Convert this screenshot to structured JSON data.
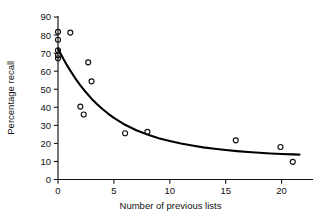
{
  "chart_data": {
    "type": "scatter",
    "title": "",
    "subtitle": "",
    "xlabel": "Number of previous lists",
    "ylabel": "Percentage recall",
    "xlim": [
      -1.2,
      23.5
    ],
    "ylim": [
      0,
      90
    ],
    "xticks": [
      0,
      5,
      10,
      15,
      20
    ],
    "yticks": [
      0,
      10,
      20,
      30,
      40,
      50,
      60,
      70,
      80,
      90
    ],
    "xticklabels": [
      "0",
      "5",
      "10",
      "15",
      "20"
    ],
    "yticklabels": [
      "0",
      "10",
      "20",
      "30",
      "40",
      "50",
      "60",
      "70",
      "80",
      "90"
    ],
    "grid": false,
    "legend": null,
    "legend_position": "none",
    "marker": "open-circle",
    "marker_color": "#111111",
    "curve_color": "#000000",
    "points": [
      {
        "x": 0.0,
        "y": 81.8
      },
      {
        "x": 1.1,
        "y": 81.4
      },
      {
        "x": 0.0,
        "y": 77.4
      },
      {
        "x": 0.0,
        "y": 71.6
      },
      {
        "x": 0.0,
        "y": 68.8
      },
      {
        "x": 0.0,
        "y": 67.2
      },
      {
        "x": 2.7,
        "y": 64.9
      },
      {
        "x": 3.0,
        "y": 54.4
      },
      {
        "x": 2.0,
        "y": 40.4
      },
      {
        "x": 2.3,
        "y": 36.0
      },
      {
        "x": 6.0,
        "y": 25.6
      },
      {
        "x": 8.0,
        "y": 26.4
      },
      {
        "x": 15.9,
        "y": 21.7
      },
      {
        "x": 19.9,
        "y": 18.0
      },
      {
        "x": 21.0,
        "y": 9.8
      }
    ],
    "fit_curve": {
      "name": "exponential-decay-fit",
      "points": [
        {
          "x": 0.0,
          "y": 72.5
        },
        {
          "x": 0.25,
          "y": 69.5
        },
        {
          "x": 0.5,
          "y": 66.6
        },
        {
          "x": 0.75,
          "y": 63.9
        },
        {
          "x": 1.0,
          "y": 61.3
        },
        {
          "x": 1.5,
          "y": 56.5
        },
        {
          "x": 2.0,
          "y": 52.2
        },
        {
          "x": 2.5,
          "y": 48.3
        },
        {
          "x": 3.0,
          "y": 44.8
        },
        {
          "x": 3.5,
          "y": 41.7
        },
        {
          "x": 4.0,
          "y": 38.9
        },
        {
          "x": 4.5,
          "y": 36.4
        },
        {
          "x": 5.0,
          "y": 34.1
        },
        {
          "x": 6.0,
          "y": 30.3
        },
        {
          "x": 7.0,
          "y": 27.3
        },
        {
          "x": 8.0,
          "y": 24.9
        },
        {
          "x": 9.0,
          "y": 22.9
        },
        {
          "x": 10.0,
          "y": 21.3
        },
        {
          "x": 11.0,
          "y": 19.9
        },
        {
          "x": 12.0,
          "y": 18.8
        },
        {
          "x": 13.0,
          "y": 17.8
        },
        {
          "x": 14.0,
          "y": 17.0
        },
        {
          "x": 15.0,
          "y": 16.3
        },
        {
          "x": 16.0,
          "y": 15.7
        },
        {
          "x": 17.0,
          "y": 15.2
        },
        {
          "x": 18.0,
          "y": 14.8
        },
        {
          "x": 19.0,
          "y": 14.4
        },
        {
          "x": 20.0,
          "y": 14.1
        },
        {
          "x": 21.0,
          "y": 13.9
        },
        {
          "x": 21.6,
          "y": 13.8
        }
      ]
    }
  }
}
